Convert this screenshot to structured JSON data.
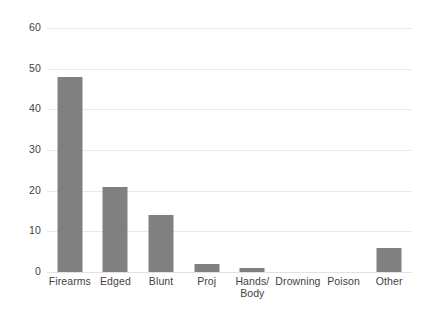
{
  "chart_data": {
    "type": "bar",
    "title": "",
    "subtitle": "",
    "xlabel": "",
    "ylabel": "",
    "categories": [
      "Firearms",
      "Edged",
      "Blunt",
      "Proj",
      "Hands/\nBody",
      "Drowning",
      "Poison",
      "Other"
    ],
    "values": [
      48,
      21,
      14,
      2,
      1,
      0,
      0,
      6
    ],
    "ylim": [
      0,
      60
    ],
    "ytick_labels": [
      "0",
      "10",
      "20",
      "30",
      "40",
      "50",
      "60"
    ],
    "ytick_values": [
      0,
      10,
      20,
      30,
      40,
      50,
      60
    ],
    "grid": true,
    "grid_axis": "y",
    "legend": false,
    "legend_position": "none",
    "series": [
      {
        "name": "",
        "values": [
          48,
          21,
          14,
          2,
          1,
          0,
          0,
          6
        ]
      }
    ]
  },
  "style": {
    "bar_color": "#808080",
    "grid_color": "#e9e9e9",
    "text_color": "#3f3f3f",
    "background_color": "#ffffff"
  }
}
